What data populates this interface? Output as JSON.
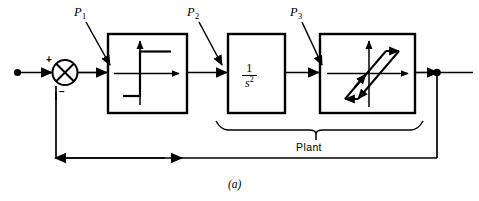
{
  "figure": {
    "caption": "(a)",
    "kind": "control-system-block-diagram"
  },
  "signals": {
    "summing_junction": {
      "plus_sign": "+",
      "minus_sign": "−",
      "icon": "summing-junction-circle-cross"
    },
    "input_node": "input-source-dot",
    "output_node": "output-takeoff-dot",
    "feedback_direction": "right-to-left"
  },
  "tap_labels": [
    {
      "id": "p1",
      "base": "P",
      "subscript": "1"
    },
    {
      "id": "p2",
      "base": "P",
      "subscript": "2"
    },
    {
      "id": "p3",
      "base": "P",
      "subscript": "3"
    }
  ],
  "blocks": [
    {
      "id": "block-1",
      "element_type": "relay-saturation-nonlinearity",
      "icon": "step-relay-characteristic-icon",
      "text": ""
    },
    {
      "id": "block-2",
      "element_type": "transfer-function",
      "icon": "",
      "numerator": "1",
      "denominator_base": "s",
      "denominator_exponent": "2",
      "text": "1/s^2"
    },
    {
      "id": "block-3",
      "element_type": "hysteresis-backlash-nonlinearity",
      "icon": "hysteresis-loop-icon",
      "text": ""
    }
  ],
  "brace": {
    "label": "Plant",
    "spans_blocks": [
      "block-2",
      "block-3"
    ]
  },
  "colors": {
    "line": "#000000",
    "background": "#ffffff",
    "text": "#000000"
  }
}
